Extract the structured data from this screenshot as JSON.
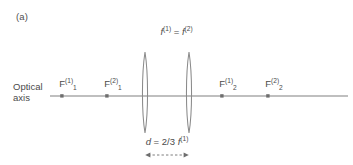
{
  "figure": {
    "panel_label": "(a)",
    "background_color": "#ffffff",
    "stroke_color": "#808080",
    "text_color": "#4a4a4a",
    "width": 353,
    "height": 165
  },
  "captions": {
    "focal_equality": {
      "f1_base": "f",
      "f1_sup": "(1)",
      "equals": " = ",
      "f2_base": "f",
      "f2_sup": "(2)"
    },
    "separation": {
      "symbol": "d",
      "equals": " = ",
      "value": "2/3 ",
      "f_base": "f",
      "f_sup": "(1)"
    }
  },
  "axis": {
    "label_line1": "Optical",
    "label_line2": "axis",
    "y": 96
  },
  "lenses": [
    {
      "name": "lens-1",
      "center_x": 145
    },
    {
      "name": "lens-2",
      "center_x": 189
    }
  ],
  "focal_points": [
    {
      "name": "F-1-1",
      "base": "F",
      "sup": "(1)",
      "sub": "1",
      "x": 62,
      "label_x": 68,
      "label_y": 78
    },
    {
      "name": "F-2-1",
      "base": "F",
      "sup": "(2)",
      "sub": "1",
      "x": 107,
      "label_x": 113,
      "label_y": 78
    },
    {
      "name": "F-1-2",
      "base": "F",
      "sup": "(1)",
      "sub": "2",
      "x": 222,
      "label_x": 228,
      "label_y": 78
    },
    {
      "name": "F-2-2",
      "base": "F",
      "sup": "(2)",
      "sub": "2",
      "x": 268,
      "label_x": 274,
      "label_y": 78
    }
  ]
}
